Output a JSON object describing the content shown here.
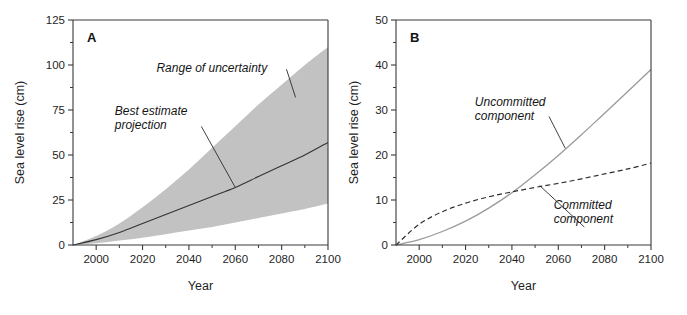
{
  "figure": {
    "background": "#ffffff",
    "band_color": "#c2c2c2",
    "axis_color": "#3a3a3a"
  },
  "chart_data": [
    {
      "type": "area",
      "panel_label": "A",
      "title": "",
      "xlabel": "Year",
      "ylabel": "Sea level rise (cm)",
      "xlim": [
        1990,
        2100
      ],
      "ylim": [
        0,
        125
      ],
      "xticks": [
        2000,
        2020,
        2040,
        2060,
        2080,
        2100
      ],
      "xtick_labels": [
        "2000",
        "2020",
        "2040",
        "2060",
        "2080",
        "2100"
      ],
      "xminor_step": 10,
      "yticks": [
        0,
        25,
        50,
        75,
        100,
        125
      ],
      "ytick_labels": [
        "0",
        "25",
        "50",
        "75",
        "100",
        "125"
      ],
      "yminor_step": 12.5,
      "grid": false,
      "legend": "none",
      "x": [
        1990,
        2000,
        2010,
        2020,
        2030,
        2040,
        2050,
        2060,
        2070,
        2080,
        2090,
        2100
      ],
      "series": [
        {
          "name": "Range of uncertainty (upper bound)",
          "style": "band-upper",
          "values": [
            0,
            5,
            12,
            21,
            31,
            42,
            54,
            66,
            78,
            89,
            100,
            110
          ]
        },
        {
          "name": "Best estimate projection",
          "style": "solid-dark",
          "values": [
            0,
            3,
            7,
            12,
            17,
            22,
            27,
            32,
            38,
            44,
            50,
            57
          ]
        },
        {
          "name": "Range of uncertainty (lower bound)",
          "style": "band-lower",
          "values": [
            0,
            1,
            2.5,
            4,
            6,
            8,
            10,
            12.5,
            15,
            17.5,
            20,
            23
          ]
        }
      ],
      "annotations": [
        {
          "text": "Range of uncertainty",
          "x_text": 2026,
          "y_text": 96,
          "leader_to_x": 2086,
          "leader_to_y": 82
        },
        {
          "text_line1": "Best estimate",
          "text_line2": "projection",
          "x_text": 2008,
          "y_text": 72,
          "leader_to_x": 2060,
          "leader_to_y": 32
        }
      ]
    },
    {
      "type": "line",
      "panel_label": "B",
      "title": "",
      "xlabel": "Year",
      "ylabel": "Sea level rise (cm)",
      "xlim": [
        1990,
        2100
      ],
      "ylim": [
        0,
        50
      ],
      "xticks": [
        2000,
        2020,
        2040,
        2060,
        2080,
        2100
      ],
      "xtick_labels": [
        "2000",
        "2020",
        "2040",
        "2060",
        "2080",
        "2100"
      ],
      "xminor_step": 10,
      "yticks": [
        0,
        10,
        20,
        30,
        40,
        50
      ],
      "ytick_labels": [
        "0",
        "10",
        "20",
        "30",
        "40",
        "50"
      ],
      "yminor_step": 5,
      "grid": false,
      "legend": "none",
      "x": [
        1990,
        2000,
        2010,
        2020,
        2030,
        2040,
        2050,
        2060,
        2070,
        2080,
        2090,
        2100
      ],
      "series": [
        {
          "name": "Uncommitted component",
          "style": "solid-light",
          "values": [
            0,
            1.2,
            3.0,
            5.3,
            8.2,
            11.6,
            15.6,
            19.9,
            24.5,
            29.3,
            34.1,
            39.0
          ]
        },
        {
          "name": "Committed component",
          "style": "dashed",
          "values": [
            0,
            4.6,
            7.4,
            9.3,
            10.7,
            11.8,
            12.8,
            13.7,
            14.7,
            15.8,
            16.9,
            18.2
          ]
        }
      ],
      "annotations": [
        {
          "text_line1": "Uncommitted",
          "text_line2": "component",
          "x_text": 2024,
          "y_text": 31,
          "leader_to_x": 2063,
          "leader_to_y": 21.5
        },
        {
          "text_line1": "Committed",
          "text_line2": "component",
          "x_text": 2058,
          "y_text": 8.0,
          "leader_to_x": 2052,
          "leader_to_y": 13.2
        }
      ]
    }
  ]
}
